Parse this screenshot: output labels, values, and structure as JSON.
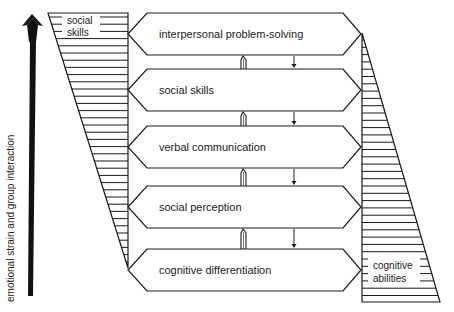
{
  "axis": {
    "label": "emotional strain and group interaction",
    "direction": "up"
  },
  "left_block": {
    "label_line1": "social",
    "label_line2": "skills"
  },
  "right_block": {
    "label_line1": "cognitive",
    "label_line2": "abilities"
  },
  "levels": [
    {
      "label": "interpersonal problem-solving"
    },
    {
      "label": "social skills"
    },
    {
      "label": "verbal communication"
    },
    {
      "label": "social perception"
    },
    {
      "label": "cognitive differentiation"
    }
  ],
  "colors": {
    "stroke": "#1a1a1a",
    "background": "#ffffff"
  }
}
